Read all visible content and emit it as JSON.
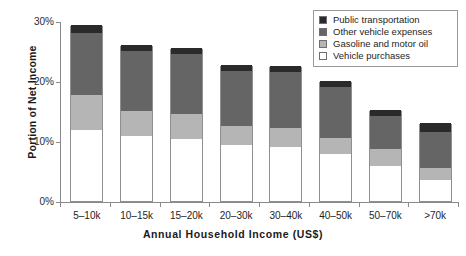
{
  "chart_data": {
    "type": "bar",
    "title": "",
    "subtitle": "",
    "xlabel": "Annual Household Income (US$)",
    "ylabel": "Portion of Net Income",
    "stacked": true,
    "grid": false,
    "legend_position": "top-right",
    "ylim": [
      0,
      30
    ],
    "ytick_labels": [
      "0%",
      "10%",
      "20%",
      "30%"
    ],
    "ytick_values": [
      0,
      10,
      20,
      30
    ],
    "categories": [
      "5–10k",
      "10–15k",
      "15–20k",
      "20–30k",
      "30–40k",
      "40–50k",
      "50–70k",
      ">70k"
    ],
    "series": [
      {
        "name": "Vehicle purchases",
        "color": "#ffffff",
        "values": [
          11.8,
          10.8,
          10.3,
          9.3,
          9.0,
          7.8,
          5.8,
          3.5
        ]
      },
      {
        "name": "Gasoline and motor oil",
        "color": "#b5b5b5",
        "values": [
          5.9,
          4.2,
          4.2,
          3.2,
          3.2,
          2.7,
          2.9,
          2.0
        ]
      },
      {
        "name": "Other vehicle expenses",
        "color": "#656565",
        "values": [
          10.3,
          10.0,
          10.0,
          9.2,
          9.3,
          8.5,
          5.5,
          6.0
        ]
      },
      {
        "name": "Public transportation",
        "color": "#2a2a2a",
        "values": [
          1.3,
          1.0,
          1.0,
          1.0,
          1.0,
          1.0,
          1.0,
          1.5
        ]
      }
    ],
    "totals": [
      29.3,
      26.0,
      25.5,
      22.7,
      22.5,
      20.0,
      15.2,
      13.0
    ]
  },
  "legend": {
    "items": [
      {
        "label": "Public transportation",
        "color": "#2a2a2a"
      },
      {
        "label": "Other vehicle expenses",
        "color": "#656565"
      },
      {
        "label": "Gasoline and motor oil",
        "color": "#b5b5b5"
      },
      {
        "label": "Vehicle purchases",
        "color": "#ffffff"
      }
    ]
  }
}
